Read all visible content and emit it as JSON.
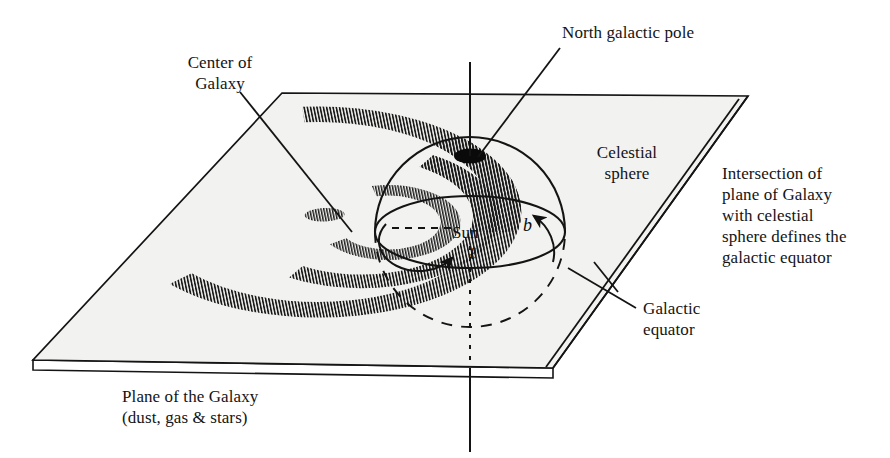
{
  "figure": {
    "background_color": "#ffffff",
    "ink_color": "#141414",
    "plane_fill": "#f2f2f0",
    "sphere_fill": "#fbfbfa",
    "arm_hatch_color": "#1a1a1a"
  },
  "labels": {
    "center_of_galaxy": "Center of\nGalaxy",
    "north_galactic_pole": "North galactic pole",
    "celestial_sphere": "Celestial\nsphere",
    "intersection_note": "Intersection of\nplane of Galaxy\nwith celestial\nsphere defines the\ngalactic equator",
    "galactic_equator": "Galactic\nequator",
    "plane_of_galaxy": "Plane of the Galaxy\n(dust, gas & stars)",
    "sun": "Sun",
    "galactic_latitude_symbol": "b",
    "galactic_longitude_symbol": "ℓ"
  },
  "annotations": {
    "center_of_galaxy_leader": "leader-line from Center of Galaxy text to galactic center",
    "north_pole_leader": "leader-line from North galactic pole text to pole dot",
    "galactic_equator_leader": "leader-line from Galactic equator text to plane/sphere intersection",
    "polar_axis": "vertical rotation axis through north galactic pole and galactic center",
    "longitude_arrow": "curved arrow in galactic plane showing increasing longitude l",
    "latitude_arrow": "curved arrow rising out of plane showing increasing latitude b"
  },
  "geometry": {
    "plane_corners": [
      [
        282,
        93
      ],
      [
        748,
        96
      ],
      [
        553,
        368
      ],
      [
        33,
        360
      ]
    ],
    "plane_thickness_px": 10,
    "sphere_center": [
      470,
      232
    ],
    "sphere_radius_x": 95,
    "sphere_radius_y": 95,
    "pole_dot": [
      470,
      155
    ],
    "equator_ellipse_ry": 36,
    "spiral_arm_count": 3
  }
}
